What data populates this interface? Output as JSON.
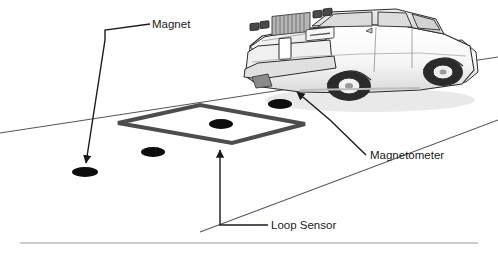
{
  "figure": {
    "background_color": "#ffffff",
    "width": 498,
    "height": 256
  },
  "labels": {
    "magnet": "Magnet",
    "magnetometer": "Magnetometer",
    "loop_sensor": "Loop Sensor"
  },
  "colors": {
    "line": "#1a1a1a",
    "loop_sensor": "#4d4d4d",
    "road_line": "#555555",
    "footer_rule": "#9a9a9a",
    "magnet_fill": "#0d0d0d",
    "car_body": "#fdfdfd",
    "car_shade_light": "#e8e8e8",
    "car_shade_mid": "#c9c9c9",
    "car_shade_dark": "#8f8f8f",
    "car_glass": "#dcdcdc",
    "tire": "#2b2b2b",
    "wheel_hub": "#f2f2f2"
  },
  "elements": {
    "loop_sensor_polygon": "118,123 200,105 305,124 232,143",
    "road_line_1": "0,133 498,57",
    "road_line_2": "200,232 498,120",
    "footer_rule_y": 243,
    "magnet_markers": [
      {
        "name": "magnet-under-car-front",
        "cx": 280,
        "cy": 104,
        "rx": 12,
        "ry": 5
      },
      {
        "name": "magnet-in-loop-center",
        "cx": 221,
        "cy": 124,
        "rx": 12,
        "ry": 5
      },
      {
        "name": "magnet-left-of-loop",
        "cx": 153,
        "cy": 152,
        "rx": 12,
        "ry": 5
      },
      {
        "name": "magnet-callout-target",
        "cx": 85,
        "cy": 172,
        "rx": 13,
        "ry": 5
      }
    ],
    "leader_magnet": "150,24 105,30 105,40 86,163",
    "leader_magnetometer": "366,155 330,120 297,92",
    "leader_loop_sensor": "268,225 220,225 220,148"
  }
}
